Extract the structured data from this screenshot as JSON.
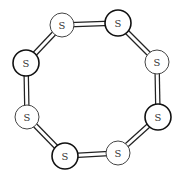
{
  "diagram": {
    "element_label": "S",
    "colors": {
      "background": "#ffffff",
      "atom_fill": "#ffffff",
      "outline": "#222222",
      "label": "#333333"
    },
    "atoms": [
      {
        "id": "s1",
        "label": "S",
        "cx": 62,
        "cy": 25,
        "r": 12,
        "emphasis": "light"
      },
      {
        "id": "s2",
        "label": "S",
        "cx": 118,
        "cy": 23,
        "r": 13,
        "emphasis": "dark"
      },
      {
        "id": "s3",
        "label": "S",
        "cx": 157,
        "cy": 62,
        "r": 12,
        "emphasis": "light"
      },
      {
        "id": "s4",
        "label": "S",
        "cx": 158,
        "cy": 117,
        "r": 13,
        "emphasis": "dark"
      },
      {
        "id": "s5",
        "label": "S",
        "cx": 118,
        "cy": 153,
        "r": 12,
        "emphasis": "light"
      },
      {
        "id": "s6",
        "label": "S",
        "cx": 65,
        "cy": 156,
        "r": 13,
        "emphasis": "dark"
      },
      {
        "id": "s7",
        "label": "S",
        "cx": 27,
        "cy": 117,
        "r": 12,
        "emphasis": "light"
      },
      {
        "id": "s8",
        "label": "S",
        "cx": 26,
        "cy": 63,
        "r": 13,
        "emphasis": "dark"
      }
    ],
    "bonds": [
      [
        "s1",
        "s2"
      ],
      [
        "s2",
        "s3"
      ],
      [
        "s3",
        "s4"
      ],
      [
        "s4",
        "s5"
      ],
      [
        "s5",
        "s6"
      ],
      [
        "s6",
        "s7"
      ],
      [
        "s7",
        "s8"
      ],
      [
        "s8",
        "s1"
      ]
    ]
  }
}
